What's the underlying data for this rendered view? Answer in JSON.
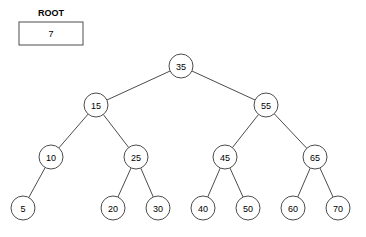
{
  "diagram": {
    "type": "binary-search-tree",
    "stroke_color": "#4c4c4c",
    "fill_color": "#ffffff",
    "text_color": "#000000",
    "node_radius": 12,
    "root_pointer": {
      "title": "ROOT",
      "value": "7",
      "box": {
        "x": 19,
        "y": 22,
        "width": 64,
        "height": 23
      },
      "title_pos": {
        "x": 51,
        "y": 13
      }
    },
    "nodes": [
      {
        "id": "n35",
        "label": "35",
        "cx": 181,
        "cy": 66,
        "level": 0
      },
      {
        "id": "n15",
        "label": "15",
        "cx": 96,
        "cy": 105,
        "level": 1
      },
      {
        "id": "n55",
        "label": "55",
        "cx": 266,
        "cy": 105,
        "level": 1
      },
      {
        "id": "n10",
        "label": "10",
        "cx": 51,
        "cy": 157,
        "level": 2
      },
      {
        "id": "n25",
        "label": "25",
        "cx": 136,
        "cy": 157,
        "level": 2
      },
      {
        "id": "n45",
        "label": "45",
        "cx": 225,
        "cy": 157,
        "level": 2
      },
      {
        "id": "n65",
        "label": "65",
        "cx": 315,
        "cy": 157,
        "level": 2
      },
      {
        "id": "n5",
        "label": "5",
        "cx": 23,
        "cy": 208,
        "level": 3
      },
      {
        "id": "n20",
        "label": "20",
        "cx": 113,
        "cy": 208,
        "level": 3
      },
      {
        "id": "n30",
        "label": "30",
        "cx": 158,
        "cy": 208,
        "level": 3
      },
      {
        "id": "n40",
        "label": "40",
        "cx": 203,
        "cy": 208,
        "level": 3
      },
      {
        "id": "n50",
        "label": "50",
        "cx": 248,
        "cy": 208,
        "level": 3
      },
      {
        "id": "n60",
        "label": "60",
        "cx": 293,
        "cy": 208,
        "level": 3
      },
      {
        "id": "n70",
        "label": "70",
        "cx": 338,
        "cy": 208,
        "level": 3
      }
    ],
    "edges": [
      {
        "from": "n35",
        "to": "n15",
        "side": "left"
      },
      {
        "from": "n35",
        "to": "n55",
        "side": "right"
      },
      {
        "from": "n15",
        "to": "n10",
        "side": "left"
      },
      {
        "from": "n15",
        "to": "n25",
        "side": "right"
      },
      {
        "from": "n55",
        "to": "n45",
        "side": "left"
      },
      {
        "from": "n55",
        "to": "n65",
        "side": "right"
      },
      {
        "from": "n10",
        "to": "n5",
        "side": "left"
      },
      {
        "from": "n25",
        "to": "n20",
        "side": "left"
      },
      {
        "from": "n25",
        "to": "n30",
        "side": "right"
      },
      {
        "from": "n45",
        "to": "n40",
        "side": "left"
      },
      {
        "from": "n45",
        "to": "n50",
        "side": "right"
      },
      {
        "from": "n65",
        "to": "n60",
        "side": "left"
      },
      {
        "from": "n65",
        "to": "n70",
        "side": "right"
      }
    ]
  }
}
